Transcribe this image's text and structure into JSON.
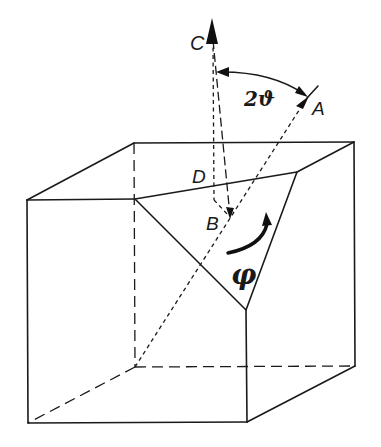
{
  "figure": {
    "type": "crystal-cube-rotation-diagram",
    "colors": {
      "ink": "#1a1a1a",
      "background": "#ffffff"
    }
  },
  "labels": {
    "C": "C",
    "A": "A",
    "D": "D",
    "B": "B",
    "angle": "2ϑ",
    "rotation": "φ"
  },
  "geometry": {
    "cube_front_face": {
      "top_left": [
        27,
        200
      ],
      "bottom_left": [
        28,
        423
      ],
      "bottom_right": [
        247,
        422
      ],
      "cut_top_right": [
        246,
        310
      ]
    },
    "cube_back_face": {
      "top_left": [
        134,
        143
      ],
      "top_right": [
        354,
        142
      ],
      "bottom_right": [
        355,
        366
      ],
      "bottom_left_hidden": [
        135,
        367
      ]
    },
    "cut_triangle": {
      "left_vertex": [
        135,
        199
      ],
      "top_right_vertex": [
        297,
        172
      ],
      "bottom_vertex": [
        246,
        310
      ]
    },
    "vectors": {
      "C_tip": [
        212,
        23
      ],
      "A_tick": [
        313,
        91
      ],
      "B_point": [
        230,
        218
      ],
      "diagonal_start": [
        135,
        367
      ]
    }
  }
}
